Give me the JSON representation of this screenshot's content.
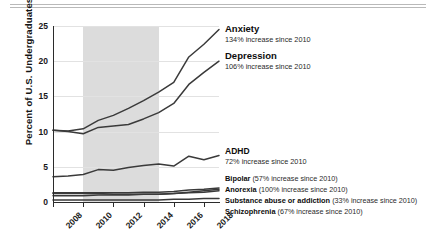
{
  "chart_data": {
    "type": "line",
    "title": "",
    "xlabel": "",
    "ylabel": "Percent of U.S. Undergraduates",
    "ylim": [
      0,
      25
    ],
    "xlim": [
      2008,
      2019
    ],
    "yticks": [
      0,
      5,
      10,
      15,
      20,
      25
    ],
    "xticks": [
      2008,
      2010,
      2012,
      2014,
      2016,
      2018
    ],
    "ytick_labels": [
      "0",
      "5",
      "10",
      "15",
      "20",
      "25"
    ],
    "xtick_labels": [
      "2008",
      "2010",
      "2012",
      "2014",
      "2016",
      "2018"
    ],
    "grid": true,
    "legend_position": "inline-right-annotations",
    "shaded_region": {
      "from": 2010,
      "to": 2015,
      "color": "#dcdcdc"
    },
    "x": [
      2008,
      2009,
      2010,
      2011,
      2012,
      2013,
      2014,
      2015,
      2016,
      2017,
      2018,
      2019
    ],
    "series": [
      {
        "name": "Anxiety",
        "color": "#3a3a3a",
        "values": [
          10.2,
          10.1,
          10.4,
          11.6,
          12.3,
          13.3,
          14.4,
          15.6,
          17.0,
          20.6,
          22.4,
          24.5
        ]
      },
      {
        "name": "Depression",
        "color": "#3a3a3a",
        "values": [
          10.2,
          10.0,
          9.7,
          10.6,
          10.8,
          11.0,
          11.8,
          12.7,
          14.0,
          16.7,
          18.4,
          20.0
        ]
      },
      {
        "name": "ADHD",
        "color": "#3a3a3a",
        "values": [
          3.6,
          3.7,
          3.9,
          4.6,
          4.5,
          4.9,
          5.2,
          5.4,
          5.1,
          6.5,
          6.0,
          6.6
        ]
      },
      {
        "name": "Bipolar",
        "color": "#3a3a3a",
        "values": [
          1.3,
          1.3,
          1.3,
          1.3,
          1.3,
          1.3,
          1.4,
          1.4,
          1.5,
          1.7,
          1.8,
          2.0
        ]
      },
      {
        "name": "Anorexia",
        "color": "#3a3a3a",
        "values": [
          0.9,
          0.9,
          0.9,
          1.0,
          1.0,
          1.0,
          1.1,
          1.1,
          1.2,
          1.4,
          1.6,
          1.8
        ]
      },
      {
        "name": "Substance abuse or addiction",
        "color": "#3a3a3a",
        "values": [
          1.2,
          1.2,
          1.2,
          1.2,
          1.1,
          1.1,
          1.1,
          1.1,
          1.2,
          1.3,
          1.4,
          1.6
        ]
      },
      {
        "name": "Schizophrenia",
        "color": "#3a3a3a",
        "values": [
          0.3,
          0.3,
          0.3,
          0.3,
          0.3,
          0.3,
          0.3,
          0.3,
          0.4,
          0.4,
          0.5,
          0.5
        ]
      }
    ],
    "annotations": [
      {
        "id": "anxiety",
        "title": "Anxiety",
        "subtitle": "134% increase since 2010"
      },
      {
        "id": "depression",
        "title": "Depression",
        "subtitle": "106% increase since 2010"
      },
      {
        "id": "adhd",
        "title": "ADHD",
        "subtitle": "72% increase since 2010"
      },
      {
        "id": "bipolar",
        "title": "Bipolar",
        "subtitle": "(57% increase since 2010)"
      },
      {
        "id": "anorexia",
        "title": "Anorexia",
        "subtitle": "(100% increase since 2010)"
      },
      {
        "id": "substance",
        "title": "Substance abuse or addiction",
        "subtitle": "(33% increase since 2010)"
      },
      {
        "id": "schizophrenia",
        "title": "Schizophrenia",
        "subtitle": "(67% increase since 2010)"
      }
    ]
  }
}
